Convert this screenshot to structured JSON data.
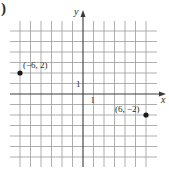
{
  "figure": {
    "corner_label": ")"
  },
  "chart_data": {
    "type": "scatter",
    "title": "",
    "xlabel": "x",
    "ylabel": "y",
    "xlim": [
      -6,
      6
    ],
    "ylim": [
      -6,
      6
    ],
    "grid": true,
    "tick_labels": {
      "x": [
        "1"
      ],
      "y": [
        "1"
      ]
    },
    "points": [
      {
        "x": -6,
        "y": 2,
        "label": "(−6, 2)"
      },
      {
        "x": 6,
        "y": -2,
        "label": "(6, −2)"
      }
    ]
  },
  "style": {
    "grid_color": "#9a9a9a",
    "axis_color": "#3a3a3a",
    "point_color": "#1a1a1a"
  }
}
